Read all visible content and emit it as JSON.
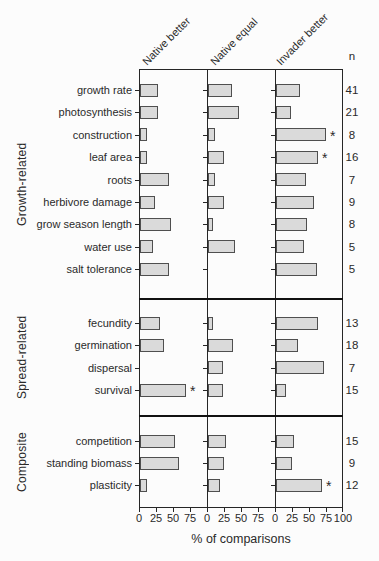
{
  "figure": {
    "background": "#fcfcfc",
    "bar_fill": "#dadada",
    "bar_border": "#4f4f4f",
    "line_color": "#262626"
  },
  "chart_data": {
    "type": "bar",
    "orientation": "horizontal",
    "columns": [
      "Native better",
      "Native equal",
      "Invader better"
    ],
    "n_label": "n",
    "xlabel": "% of comparisons",
    "xlim": [
      0,
      100
    ],
    "xticks": [
      "0",
      "25",
      "50",
      "75"
    ],
    "xtick_end": "100",
    "sig_marker": "*",
    "groups": [
      {
        "label": "Growth-related",
        "rows": [
          {
            "category": "growth rate",
            "n": 41,
            "values": [
              27,
              35,
              35
            ],
            "sig": null
          },
          {
            "category": "photosynthesis",
            "n": 21,
            "values": [
              27,
              45,
              22
            ],
            "sig": null
          },
          {
            "category": "construction",
            "n": 8,
            "values": [
              11,
              10,
              73
            ],
            "sig": 2
          },
          {
            "category": "leaf area",
            "n": 16,
            "values": [
              11,
              23,
              62
            ],
            "sig": 2
          },
          {
            "category": "roots",
            "n": 7,
            "values": [
              42,
              10,
              44
            ],
            "sig": null
          },
          {
            "category": "herbivore damage",
            "n": 9,
            "values": [
              22,
              23,
              56
            ],
            "sig": null
          },
          {
            "category": "grow season length",
            "n": 8,
            "values": [
              45,
              8,
              46
            ],
            "sig": null
          },
          {
            "category": "water use",
            "n": 5,
            "values": [
              19,
              40,
              41
            ],
            "sig": null
          },
          {
            "category": "salt tolerance",
            "n": 5,
            "values": [
              42,
              0,
              60
            ],
            "sig": null
          }
        ]
      },
      {
        "label": "Spread-related",
        "rows": [
          {
            "category": "fecundity",
            "n": 13,
            "values": [
              30,
              8,
              62
            ],
            "sig": null
          },
          {
            "category": "germination",
            "n": 18,
            "values": [
              35,
              37,
              33
            ],
            "sig": null
          },
          {
            "category": "dispersal",
            "n": 7,
            "values": [
              0,
              22,
              71
            ],
            "sig": null
          },
          {
            "category": "survival",
            "n": 15,
            "values": [
              67,
              22,
              14
            ],
            "sig": 0
          }
        ]
      },
      {
        "label": "Composite",
        "rows": [
          {
            "category": "competition",
            "n": 15,
            "values": [
              52,
              27,
              27
            ],
            "sig": null
          },
          {
            "category": "standing biomass",
            "n": 9,
            "values": [
              58,
              24,
              24
            ],
            "sig": null
          },
          {
            "category": "plasticity",
            "n": 12,
            "values": [
              10,
              18,
              68
            ],
            "sig": 2
          }
        ]
      }
    ]
  }
}
